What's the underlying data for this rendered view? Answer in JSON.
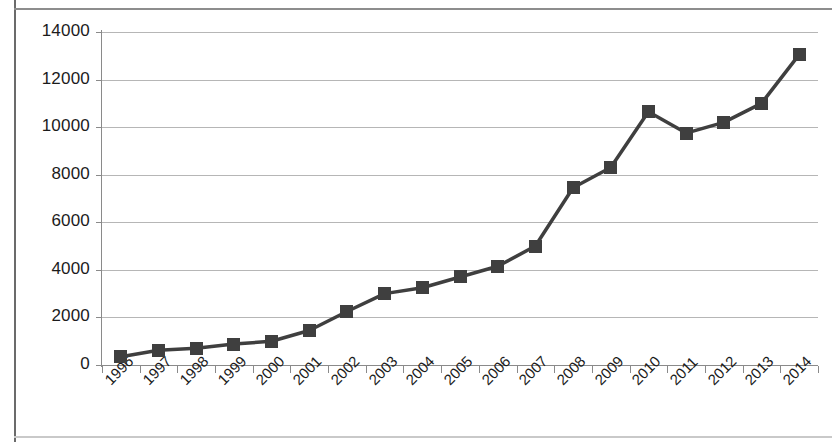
{
  "chart_data": {
    "type": "line",
    "title": "",
    "xlabel": "",
    "ylabel": "",
    "categories": [
      "1996",
      "1997",
      "1998",
      "1999",
      "2000",
      "2001",
      "2002",
      "2003",
      "2004",
      "2005",
      "2006",
      "2007",
      "2008",
      "2009",
      "2010",
      "2011",
      "2012",
      "2013",
      "2014"
    ],
    "values": [
      350,
      620,
      700,
      880,
      1000,
      1450,
      2250,
      3000,
      3250,
      3700,
      4150,
      5000,
      7450,
      8300,
      10650,
      9750,
      10200,
      11000,
      13050
    ],
    "series": [
      {
        "name": "Series 1",
        "values": [
          350,
          620,
          700,
          880,
          1000,
          1450,
          2250,
          3000,
          3250,
          3700,
          4150,
          5000,
          7450,
          8300,
          10650,
          9750,
          10200,
          11000,
          13050
        ]
      }
    ],
    "ylim": [
      0,
      14000
    ],
    "ytick_labels": [
      "0",
      "2000",
      "4000",
      "6000",
      "8000",
      "10000",
      "12000",
      "14000"
    ],
    "ytick_values": [
      0,
      2000,
      4000,
      6000,
      8000,
      10000,
      12000,
      14000
    ],
    "grid": true,
    "legend": "none",
    "marker": "square",
    "marker_color": "#3f3f3f",
    "line_color": "#3f3f3f",
    "gridline_color": "#b6b6b6",
    "axis_color": "#8a8a8a",
    "background_color": "#ffffff",
    "xtick_label_rotation": -45
  }
}
